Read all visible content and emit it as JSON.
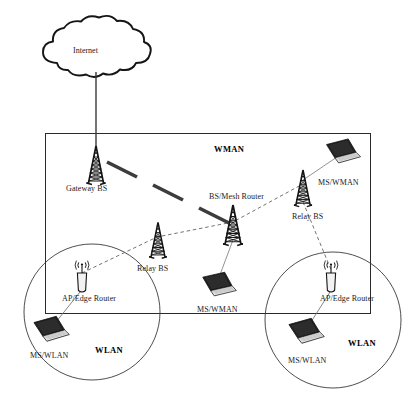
{
  "figure": {
    "type": "network-architecture-diagram",
    "background_color": "#ffffff",
    "stroke_color": "#1a1a1a",
    "width": 413,
    "height": 401
  },
  "cloud": {
    "label": "Internet",
    "icon": "cloud-icon"
  },
  "zones": [
    {
      "id": "wman",
      "label": "WMAN",
      "shape": "rectangle"
    },
    {
      "id": "wlan-left",
      "label": "WLAN",
      "shape": "circle"
    },
    {
      "id": "wlan-right",
      "label": "WLAN",
      "shape": "circle"
    }
  ],
  "nodes": [
    {
      "id": "gateway-bs",
      "label": "Gateway BS",
      "icon": "tower-icon"
    },
    {
      "id": "bs-mesh-router",
      "label": "BS/Mesh Router",
      "icon": "tower-icon"
    },
    {
      "id": "relay-bs-left",
      "label": "Relay BS",
      "icon": "tower-icon"
    },
    {
      "id": "relay-bs-right",
      "label": "Relay BS",
      "icon": "tower-icon"
    },
    {
      "id": "ms-wman-top",
      "label": "MS/WMAN",
      "icon": "laptop-icon"
    },
    {
      "id": "ms-wman-center",
      "label": "MS/WMAN",
      "icon": "laptop-icon"
    },
    {
      "id": "ap-edge-router-left",
      "label": "AP/Edge Router",
      "icon": "access-point-icon"
    },
    {
      "id": "ap-edge-router-right",
      "label": "AP/Edge Router",
      "icon": "access-point-icon"
    },
    {
      "id": "ms-wlan-left",
      "label": "MS/WLAN",
      "icon": "laptop-icon"
    },
    {
      "id": "ms-wlan-right",
      "label": "MS/WLAN",
      "icon": "laptop-icon"
    }
  ],
  "links": [
    {
      "from": "cloud",
      "to": "gateway-bs",
      "style": "solid-thin"
    },
    {
      "from": "gateway-bs",
      "to": "bs-mesh-router",
      "style": "thick-dashed"
    },
    {
      "from": "ap-edge-router-left",
      "to": "relay-bs-left",
      "style": "thin-dashed"
    },
    {
      "from": "relay-bs-left",
      "to": "bs-mesh-router",
      "style": "thin-dashed"
    },
    {
      "from": "bs-mesh-router",
      "to": "relay-bs-right",
      "style": "thin-dashed"
    },
    {
      "from": "relay-bs-right",
      "to": "ms-wman-top",
      "style": "solid-thin"
    },
    {
      "from": "relay-bs-right",
      "to": "ap-edge-router-right",
      "style": "thin-dashed"
    },
    {
      "from": "bs-mesh-router",
      "to": "ms-wman-center",
      "style": "solid-thin"
    },
    {
      "from": "ap-edge-router-left",
      "to": "ms-wlan-left",
      "style": "solid-thin"
    },
    {
      "from": "ap-edge-router-right",
      "to": "ms-wlan-right",
      "style": "solid-thin"
    }
  ]
}
